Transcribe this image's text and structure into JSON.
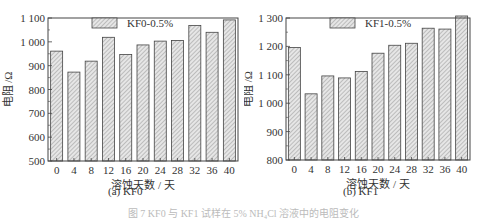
{
  "chart_data": [
    {
      "type": "bar",
      "title": "(a) KF0",
      "xlabel": "溶蚀天数 / 天",
      "ylabel": "电阻 /Ω",
      "categories": [
        "0",
        "4",
        "8",
        "12",
        "16",
        "20",
        "24",
        "28",
        "32",
        "36",
        "40"
      ],
      "series": [
        {
          "name": "KF0-0.5%",
          "values": [
            961,
            873,
            919,
            1019,
            947,
            987,
            1003,
            1006,
            1069,
            1040,
            1092
          ]
        }
      ],
      "yticks": [
        "500",
        "600",
        "700",
        "800",
        "900",
        "1 000",
        "1 100"
      ],
      "ylim": [
        500,
        1100
      ],
      "grid": false,
      "legend_position": "top-center"
    },
    {
      "type": "bar",
      "title": "(b) KF1",
      "xlabel": "溶蚀天数 / 天",
      "ylabel": "电阻 /Ω",
      "categories": [
        "0",
        "4",
        "8",
        "12",
        "16",
        "20",
        "24",
        "28",
        "32",
        "36",
        "40"
      ],
      "series": [
        {
          "name": "KF1-0.5%",
          "values": [
            1196,
            1033,
            1096,
            1089,
            1112,
            1176,
            1204,
            1211,
            1264,
            1261,
            1309
          ]
        }
      ],
      "yticks": [
        "800",
        "900",
        "1 000",
        "1 100",
        "1 200",
        "1 300"
      ],
      "ylim": [
        800,
        1300
      ],
      "grid": false,
      "legend_position": "top-center"
    }
  ],
  "captions": {
    "a": "(a) KF0",
    "b": "(b) KF1",
    "figure": "图 7  KF0 与 KF1 试样在 5% NH₄Cl 溶液中的电阻变化"
  },
  "colors": {
    "bar_fill": "#e6e6e6",
    "hatch": "#8a8a8a",
    "axis": "#444444"
  }
}
